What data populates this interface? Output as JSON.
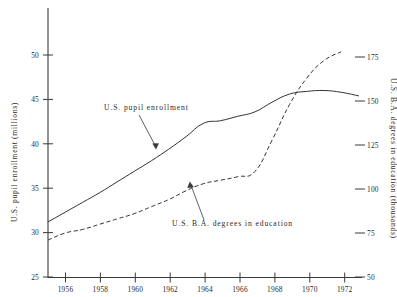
{
  "chart_data": {
    "type": "line",
    "title": "",
    "xlabel": "",
    "ylabel": "U.S. pupil enrollment (millions)",
    "y2label": "U.S. B.A. degrees in education (thousands)",
    "xlim": [
      1955,
      1973.2
    ],
    "ylim": [
      25,
      53
    ],
    "y2lim": [
      50,
      183
    ],
    "grid": false,
    "legend": "annotations-inline",
    "x_ticks": [
      "1956",
      "1958",
      "1960",
      "1962",
      "1964",
      "1966",
      "1968",
      "1970",
      "1972"
    ],
    "x_tick_values": [
      1956,
      1958,
      1960,
      1962,
      1964,
      1966,
      1968,
      1970,
      1972
    ],
    "y_ticks": [
      "25",
      "30",
      "35",
      "40",
      "45",
      "50"
    ],
    "y_tick_values": [
      25,
      30,
      35,
      40,
      45,
      50
    ],
    "y2_ticks": [
      "50",
      "75",
      "100",
      "125",
      "150",
      "175"
    ],
    "y2_tick_values": [
      50,
      75,
      100,
      125,
      150,
      175
    ],
    "series": [
      {
        "name": "U.S. pupil enrollment",
        "style": "solid",
        "axis": "left",
        "units": "millions",
        "x": [
          1955,
          1956,
          1957,
          1958,
          1959,
          1960,
          1961,
          1962,
          1963,
          1964,
          1965,
          1966,
          1967,
          1968,
          1969,
          1970,
          1971,
          1972,
          1973
        ],
        "values": [
          31.2,
          32.3,
          33.4,
          34.5,
          35.7,
          36.9,
          38.1,
          39.4,
          40.8,
          42.3,
          42.6,
          43.1,
          43.6,
          44.7,
          45.6,
          45.9,
          46.0,
          45.8,
          45.4
        ]
      },
      {
        "name": "U.S. B.A. degrees in education",
        "style": "dashed",
        "axis": "right",
        "units": "thousands",
        "x": [
          1955,
          1956,
          1957,
          1958,
          1959,
          1960,
          1961,
          1962,
          1963,
          1964,
          1965,
          1966,
          1967,
          1968,
          1969,
          1970,
          1971,
          1972
        ],
        "values": [
          71,
          75,
          77,
          80,
          83,
          86,
          90,
          94,
          99,
          103,
          105,
          107,
          110,
          128,
          148,
          163,
          173,
          178
        ]
      }
    ],
    "annotations": [
      {
        "text": "U.S. pupil enrollment",
        "text_x": 104,
        "text_y": 110,
        "target_x": 155,
        "target_y": 148
      },
      {
        "text": "U.S. B.A. degrees in education",
        "text_x": 172,
        "text_y": 226,
        "target_x": 190,
        "target_y": 182
      }
    ]
  },
  "axes": {
    "left_title": "U.S. pupil enrollment (millions)",
    "right_title": "U.S. B.A. degrees in education (thousands)"
  }
}
